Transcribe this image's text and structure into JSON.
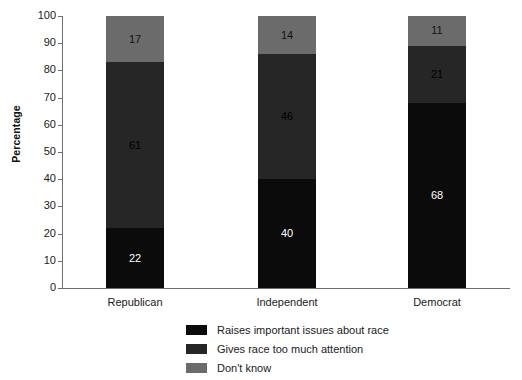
{
  "chart_data": {
    "type": "bar",
    "subtype": "stacked-vertical-100",
    "title": "",
    "xlabel": "",
    "ylabel": "Percentage",
    "ylim": [
      0,
      100
    ],
    "ytick_step": 10,
    "yticks": [
      "100",
      "90",
      "80",
      "70",
      "60",
      "50",
      "40",
      "30",
      "20",
      "10",
      "0"
    ],
    "grid": false,
    "legend_position": "bottom",
    "categories": [
      "Republican",
      "Independent",
      "Democrat"
    ],
    "series": [
      {
        "name": "Raises important issues about race",
        "color": "#0b0b0b",
        "values": [
          22,
          40,
          68
        ]
      },
      {
        "name": "Gives race too much attention",
        "color": "#262626",
        "values": [
          61,
          46,
          21
        ]
      },
      {
        "name": "Don't know",
        "color": "#6b6b6b",
        "values": [
          17,
          14,
          11
        ]
      }
    ]
  },
  "axis": {
    "y_title": "Percentage"
  }
}
